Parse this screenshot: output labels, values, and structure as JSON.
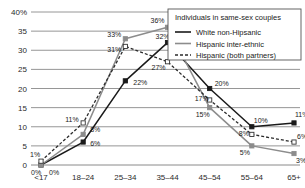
{
  "chart_data": {
    "type": "line",
    "title": "",
    "subtitle": "",
    "xlabel": "",
    "ylabel": "",
    "categories": [
      "<17",
      "18–24",
      "25–34",
      "35–44",
      "45–54",
      "55–64",
      "65+"
    ],
    "ylim": [
      0,
      40
    ],
    "yticks": [
      0,
      5,
      10,
      15,
      20,
      25,
      30,
      35,
      40
    ],
    "ytick_labels": [
      "0",
      "5",
      "10",
      "15",
      "20",
      "25",
      "30",
      "35",
      "40%"
    ],
    "grid": true,
    "legend_position": "top-right",
    "legend_title": "Individuals in same-sex couples",
    "series": [
      {
        "name": "White non-Hipsanic",
        "values": [
          0,
          6,
          22,
          32,
          20,
          10,
          11
        ],
        "labels": [
          "0%",
          "6%",
          "22%",
          "32%",
          "20%",
          "10%",
          "11%"
        ],
        "color": "#1a1a1a",
        "line_style": "solid",
        "marker": "filled-square"
      },
      {
        "name": "Hispanic inter-ethnic",
        "values": [
          0,
          8,
          33,
          36,
          15,
          5,
          3
        ],
        "labels": [
          "0%",
          "8%",
          "33%",
          "36%",
          "15%",
          "5%",
          "3%"
        ],
        "color": "#8c8c8c",
        "line_style": "solid",
        "marker": "filled-square"
      },
      {
        "name": "Hispanic (both partners)",
        "values": [
          1,
          11,
          31,
          27,
          17,
          8,
          6
        ],
        "labels": [
          "1%",
          "11%",
          "31%",
          "27%",
          "17%",
          "8%",
          "6%"
        ],
        "color": "#2b2b2b",
        "line_style": "dashed",
        "marker": "open-square"
      }
    ]
  },
  "legend": {
    "title": "Individuals in same-sex couples",
    "items": [
      {
        "label": "White non-Hipsanic"
      },
      {
        "label": "Hispanic inter-ethnic"
      },
      {
        "label": "Hispanic (both partners)"
      }
    ]
  },
  "axis": {
    "y_labels": [
      "40%",
      "35",
      "30",
      "25",
      "20",
      "15",
      "10",
      "5",
      "0"
    ],
    "x_labels": [
      "<17",
      "18–24",
      "25–34",
      "35–44",
      "45–54",
      "55–64",
      "65+"
    ]
  },
  "colors": {
    "white_non_hispanic": "#1a1a1a",
    "hispanic_inter_ethnic": "#8c8c8c",
    "hispanic_both": "#2b2b2b",
    "grid": "#8a8a8a",
    "background": "#ffffff"
  }
}
